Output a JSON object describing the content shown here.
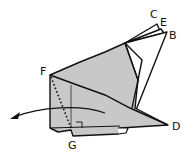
{
  "diagram": {
    "title": "",
    "colors": {
      "fill": "#c8c8c8",
      "stroke": "#111111",
      "background": "#ffffff"
    },
    "labels": {
      "C": "C",
      "E": "E",
      "B": "B",
      "F": "F",
      "D": "D",
      "G": "G"
    },
    "annotations": {
      "fold_line": "dotted line F to G",
      "right_angle_mark": "right angle at G",
      "arrow": "curved arrow pointing left (fold direction)"
    }
  }
}
